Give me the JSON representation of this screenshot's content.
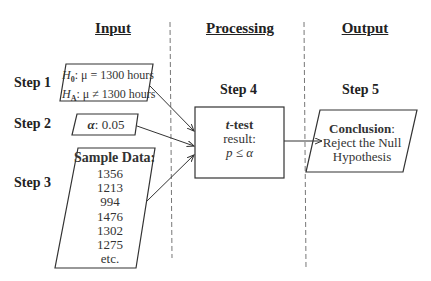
{
  "columns": {
    "input": "Input",
    "processing": "Processing",
    "output": "Output"
  },
  "steps": {
    "step1": "Step 1",
    "step2": "Step 2",
    "step3": "Step 3",
    "step4": "Step 4",
    "step5": "Step 5"
  },
  "hypotheses": {
    "h0_symbol": "H",
    "h0_sub": "0",
    "h0_text": ": μ = 1300 hours",
    "ha_symbol": "H",
    "ha_sub": "A",
    "ha_text": ": μ ≠ 1300 hours"
  },
  "alpha": {
    "symbol": "α",
    "value": ": 0.05"
  },
  "sample_data": {
    "title": "Sample Data:",
    "values": [
      "1356",
      "1213",
      "994",
      "1476",
      "1302",
      "1275",
      "etc."
    ]
  },
  "process": {
    "t": "t",
    "test": "-test",
    "result_label": "result:",
    "result_expr": "p ≤ α"
  },
  "conclusion": {
    "title": "Conclusion",
    "colon": ":",
    "line1": "Reject the Null",
    "line2": "Hypothesis"
  }
}
